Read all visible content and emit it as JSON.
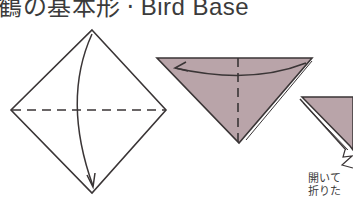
{
  "title": {
    "ja": "鶴の基本形",
    "separator": "·",
    "en": "Bird Base"
  },
  "colors": {
    "paper_colored": "#b9a4a9",
    "paper_white": "#ffffff",
    "line": "#3a3536"
  },
  "steps": [
    {
      "id": 1,
      "shape": "square-diamond",
      "fold": "valley fold top corner down along dashed diagonal"
    },
    {
      "id": 2,
      "shape": "triangle",
      "fold": "valley fold right corner to left along dashed center line"
    },
    {
      "id": 3,
      "shape": "small-triangle-partial",
      "fold": "open and squash"
    }
  ],
  "caption": {
    "line1": "開いて",
    "line2": "折りた"
  }
}
